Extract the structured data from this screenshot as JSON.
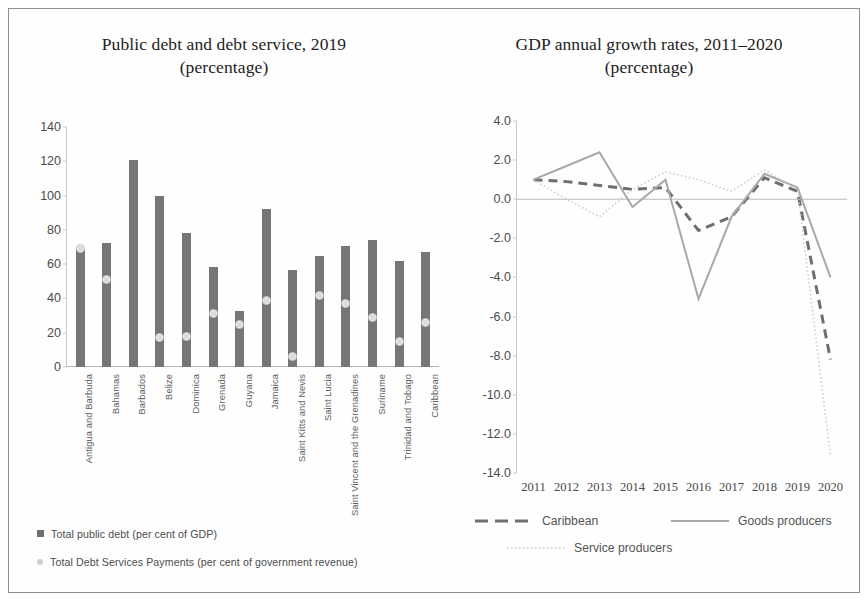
{
  "figure": {
    "border_color": "#8e8e8e",
    "background": "#fefefe"
  },
  "left": {
    "title_line1": "Public debt and debt service, 2019",
    "title_line2": "(percentage)",
    "legend": [
      {
        "label": "Total public debt (per cent of GDP)",
        "marker": "bar-swatch",
        "color": "#6f6f6f"
      },
      {
        "label": "Total Debt Services Payments (per cent of government revenue)",
        "marker": "dot-swatch",
        "color": "#cfcfcf"
      }
    ]
  },
  "right": {
    "title_line1": "GDP annual growth rates, 2011–2020",
    "title_line2": "(percentage)",
    "legend": [
      {
        "label": "Caribbean",
        "style": "dashed",
        "color": "#6e6e6e"
      },
      {
        "label": "Goods producers",
        "style": "solid",
        "color": "#a8a8a8"
      },
      {
        "label": "Service producers",
        "style": "dotted",
        "color": "#cdcdcd"
      }
    ]
  },
  "chart_data": [
    {
      "type": "bar",
      "title": "Public debt and debt service, 2019 (percentage)",
      "xlabel": "",
      "ylabel": "",
      "ylim": [
        0,
        140
      ],
      "yticks": [
        "0",
        "20",
        "40",
        "60",
        "80",
        "100",
        "120",
        "140"
      ],
      "grid": false,
      "legend_position": "below",
      "categories": [
        "Antigua and Barbuda",
        "Bahamas",
        "Barbados",
        "Belize",
        "Dominica",
        "Grenada",
        "Guyana",
        "Jamaica",
        "Saint Kitts and Nevis",
        "Saint Lucia",
        "Saint Vincent and the Grenadines",
        "Suriname",
        "Trinidad and Tobago",
        "Caribbean"
      ],
      "series": [
        {
          "name": "Total public debt (per cent of GDP)",
          "render": "bar",
          "values": [
            69,
            72.5,
            120.5,
            99.5,
            78,
            58.5,
            32.5,
            92,
            56.5,
            65,
            70.5,
            74,
            62,
            67
          ]
        },
        {
          "name": "Total Debt Services Payments (per cent of government revenue)",
          "render": "marker",
          "values": [
            69,
            51,
            null,
            17,
            18,
            31,
            25,
            39,
            6,
            42,
            37,
            29,
            15,
            26
          ]
        }
      ]
    },
    {
      "type": "line",
      "title": "GDP annual growth rates, 2011–2020 (percentage)",
      "xlabel": "",
      "ylabel": "",
      "ylim": [
        -14,
        4
      ],
      "yticks": [
        "4.0",
        "2.0",
        "0.0",
        "-2.0",
        "-4.0",
        "-6.0",
        "-8.0",
        "-10.0",
        "-12.0",
        "-14.0"
      ],
      "grid": false,
      "legend_position": "below",
      "x": [
        "2011",
        "2012",
        "2013",
        "2014",
        "2015",
        "2016",
        "2017",
        "2018",
        "2019",
        "2020"
      ],
      "series": [
        {
          "name": "Caribbean",
          "style": "dashed",
          "color": "#6e6e6e",
          "values": [
            1.0,
            0.9,
            0.7,
            0.5,
            0.6,
            -1.6,
            -0.9,
            1.1,
            0.4,
            -8.2
          ]
        },
        {
          "name": "Goods producers",
          "style": "solid",
          "color": "#a8a8a8",
          "values": [
            1.0,
            1.7,
            2.4,
            -0.4,
            1.0,
            -5.1,
            -0.9,
            1.3,
            0.6,
            -4.0
          ]
        },
        {
          "name": "Service producers",
          "style": "dotted",
          "color": "#cdcdcd",
          "values": [
            1.0,
            0.0,
            -0.9,
            0.5,
            1.4,
            1.0,
            0.4,
            1.5,
            0.5,
            -13.1
          ]
        }
      ]
    }
  ]
}
